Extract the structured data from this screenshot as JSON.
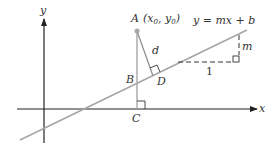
{
  "figure": {
    "type": "geometry-diagram",
    "title": "",
    "axes": {
      "x_label": "x",
      "y_label": "y"
    },
    "line": {
      "equation": "y = mx + b",
      "color": "#a6a6a6"
    },
    "points": {
      "A": {
        "label": "A",
        "coords_label": "(x",
        "x0_sub": "0",
        "sep": ", y",
        "y0_sub": "0",
        "close": ")"
      },
      "B": {
        "label": "B"
      },
      "C": {
        "label": "C"
      },
      "D": {
        "label": "D"
      }
    },
    "segments": {
      "distance_label": "d",
      "run_label": "1",
      "rise_label": "m"
    },
    "colors": {
      "axis": "#222222",
      "construction": "#a6a6a6",
      "text": "#333333",
      "dashed": "#333333"
    }
  }
}
